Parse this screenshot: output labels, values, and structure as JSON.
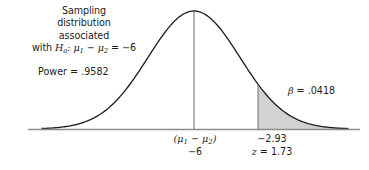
{
  "figure": {
    "type": "statistical-distribution-diagram",
    "background_color": "#ffffff",
    "curve_color": "#231f20",
    "baseline_color": "#8d8d8d",
    "shade_fill": "#d2d2d2",
    "text_color": "#1d1b1b"
  },
  "caption": {
    "line1": "Sampling",
    "line2": "distribution",
    "line3": "associated",
    "line4_prefix": "with ",
    "line4_symbol": "H",
    "line4_subscript": "a",
    "line4_rest": ": μ",
    "line4_sub1": "1",
    "line4_minus": " − μ",
    "line4_sub2": "2",
    "line4_equals": " = −6",
    "full_text": "Sampling distribution associated with Ha: μ1 − μ2 = −6"
  },
  "annotations": {
    "power_label": "Power = .9582",
    "power_value": ".9582",
    "beta_symbol": "β",
    "beta_equals": " = .0418",
    "beta_value": ".0418"
  },
  "axis": {
    "center_tick": {
      "label_open": "(μ",
      "label_sub1": "1",
      "label_minus": " − μ",
      "label_sub2": "2",
      "label_close": ")",
      "label_plain": "(μ1 − μ2)",
      "value": "−6"
    },
    "critical_tick": {
      "value": "−2.93",
      "z_symbol": "z",
      "z_equals": " = 1.73",
      "z_plain": "z = 1.73"
    }
  },
  "chart_data": {
    "type": "area",
    "title": "",
    "xlabel": "",
    "ylabel": "",
    "distribution": "normal",
    "mean": -6,
    "mean_label": "(μ1 − μ2) = −6",
    "critical_value": -2.93,
    "critical_z": 1.73,
    "power": 0.9582,
    "beta": 0.0418,
    "shaded_region": "right tail beyond −2.93",
    "shaded_region_label": "β = .0418",
    "unshaded_region_label": "Power = .9582",
    "grid": false,
    "legend": "none",
    "geometry": {
      "baseline_y": 129,
      "baseline_x_start": 28,
      "baseline_x_end": 360,
      "peak_x": 194,
      "peak_y": 11,
      "sigma_px": 46,
      "curve_x_start": 42,
      "curve_x_end": 348,
      "critical_x": 258
    }
  }
}
